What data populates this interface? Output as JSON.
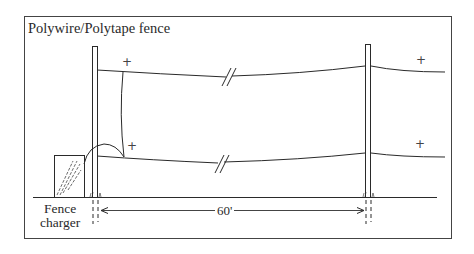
{
  "title": "Polywire/Polytape fence",
  "charger": {
    "label_line1": "Fence",
    "label_line2": "charger"
  },
  "dimension": {
    "label": "60'"
  },
  "polarity": {
    "top_left": "+",
    "bottom_left": "+",
    "top_right": "+",
    "bottom_right": "+"
  },
  "elements": {
    "posts": [
      "left-post",
      "right-post"
    ],
    "wires": [
      "top-wire",
      "bottom-wire"
    ],
    "break_symbols": 2
  },
  "colors": {
    "line": "#2a2a2a",
    "background": "#ffffff"
  }
}
